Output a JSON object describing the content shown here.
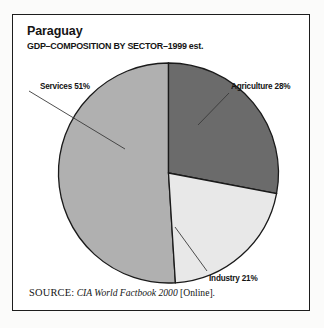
{
  "figure": {
    "title": "Paraguay",
    "subtitle": "GDP–COMPOSITION BY SECTOR–1999 est.",
    "source_prefix": "SOURCE:",
    "source_title": "CIA World Factbook 2000",
    "source_suffix": "[Online].",
    "frame_color": "#1d1d1d",
    "background": "#ffffff"
  },
  "chart_data": {
    "type": "pie",
    "title": "Paraguay",
    "subtitle": "GDP–COMPOSITION BY SECTOR–1999 est.",
    "xlabel": "",
    "ylabel": "",
    "units": "percent",
    "start_angle_deg": 0,
    "direction": "clockwise",
    "legend": "none (direct labels with leader lines)",
    "grid": false,
    "categories": [
      "Agriculture",
      "Industry",
      "Services"
    ],
    "values": [
      28,
      21,
      51
    ],
    "labels": [
      "Agriculture 28%",
      "Industry 21%",
      "Services 51%"
    ],
    "colors": [
      "#6b6b6b",
      "#e8e8e8",
      "#b0b0b0"
    ],
    "slices": [
      {
        "name": "Agriculture",
        "label": "Agriculture 28%",
        "value": 28,
        "color": "#6b6b6b",
        "start_deg": 0,
        "end_deg": 100.8
      },
      {
        "name": "Industry",
        "label": "Industry 21%",
        "value": 21,
        "color": "#e8e8e8",
        "start_deg": 100.8,
        "end_deg": 176.4
      },
      {
        "name": "Services",
        "label": "Services 51%",
        "value": 51,
        "color": "#b0b0b0",
        "start_deg": 176.4,
        "end_deg": 360
      }
    ]
  }
}
